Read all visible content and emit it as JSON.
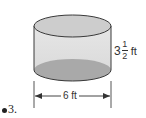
{
  "figure": {
    "shape": "cylinder",
    "colors": {
      "side_fill": "#e0e0e0",
      "top_fill": "#cfcfcf",
      "bottom_fill": "#a8a8a8",
      "stroke": "#3a3a3a"
    },
    "height": {
      "whole": "3",
      "numerator": "1",
      "denominator": "2",
      "unit": "ft"
    },
    "diameter": {
      "label": "6 ft"
    }
  },
  "problem": {
    "marker": "●",
    "number": "3."
  }
}
